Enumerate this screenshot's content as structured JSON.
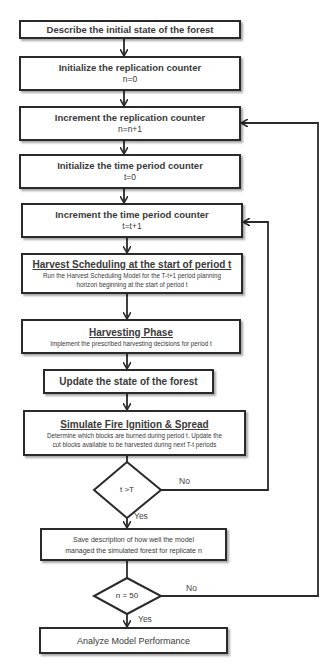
{
  "flowchart": {
    "steps": [
      {
        "id": "describe",
        "text": "Describe the initial state of the forest"
      },
      {
        "id": "init_rep",
        "text": "Initialize the replication counter",
        "formula": "n=0"
      },
      {
        "id": "inc_rep",
        "text": "Increment the replication counter",
        "formula": "n=n+1"
      },
      {
        "id": "init_time",
        "text": "Initialize the time period counter",
        "formula": "t=0"
      },
      {
        "id": "inc_time",
        "text": "Increment the time period counter",
        "formula": "t=t+1"
      },
      {
        "id": "harvest_sched",
        "heading": "Harvest Scheduling at the start of period t",
        "line1": "Run the Harvest Scheduling Model for the T-t+1 period planning",
        "line2": "horizon beginning at the start of period t"
      },
      {
        "id": "harvest_phase",
        "heading": "Harvesting Phase",
        "line1": "Implement the prescribed harvesting decisions for period t"
      },
      {
        "id": "update",
        "text": "Update the state of the forest"
      },
      {
        "id": "fire",
        "heading": "Simulate Fire Ignition & Spread",
        "line1": "Determine which blocks are burned during period t. Update the",
        "line2": "cut blocks available to be harvested during next T-t periods"
      },
      {
        "id": "save",
        "line1": "Save description of how well the model",
        "line2": "managed the simulated forest for replicate n"
      },
      {
        "id": "analyze",
        "text": "Analyze Model Performance"
      }
    ],
    "decisions": [
      {
        "id": "time_check",
        "condition": "t >T",
        "yes_label": "Yes",
        "no_label": "No"
      },
      {
        "id": "rep_check",
        "condition": "n = 50",
        "yes_label": "Yes",
        "no_label": "No"
      }
    ],
    "colors": {
      "stroke": "#2a2a2a",
      "fill": "#ffffff",
      "text": "#3a3a3a"
    }
  }
}
